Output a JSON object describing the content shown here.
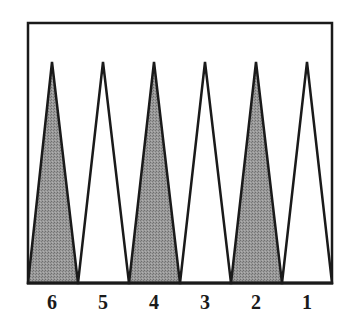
{
  "diagram": {
    "points": [
      {
        "label": "6",
        "shaded": true
      },
      {
        "label": "5",
        "shaded": false
      },
      {
        "label": "4",
        "shaded": true
      },
      {
        "label": "3",
        "shaded": false
      },
      {
        "label": "2",
        "shaded": true
      },
      {
        "label": "1",
        "shaded": false
      }
    ],
    "colors": {
      "border": "#1a1a1a",
      "shaded_fill": "#8c8c8c",
      "unshaded_fill": "#ffffff",
      "background": "#ffffff"
    }
  }
}
